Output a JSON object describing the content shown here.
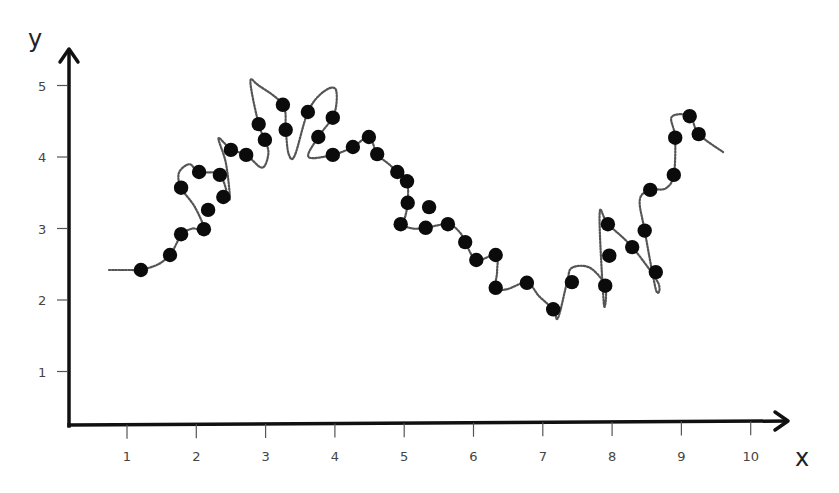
{
  "chart_data": {
    "type": "scatter",
    "title": "",
    "xlabel": "x",
    "ylabel": "y",
    "xlim": [
      0.2,
      10.6
    ],
    "ylim": [
      0.2,
      5.5
    ],
    "x_ticks": [
      1,
      2,
      3,
      4,
      5,
      6,
      7,
      8,
      9,
      10
    ],
    "y_ticks": [
      1,
      2,
      3,
      4,
      5
    ],
    "grid": false,
    "legend": null,
    "colors": {
      "points": "#0b0b0b",
      "curve": "#555555",
      "axis": "#111111",
      "tick_label": "#444444"
    },
    "series": [
      {
        "name": "data points",
        "style": "filled-circle",
        "x": [
          1.2,
          1.62,
          1.78,
          2.11,
          2.17,
          1.78,
          2.04,
          2.34,
          2.39,
          2.5,
          2.72,
          2.9,
          2.99,
          3.25,
          3.29,
          3.61,
          3.76,
          3.97,
          3.97,
          4.26,
          4.49,
          4.61,
          4.9,
          5.04,
          5.05,
          5.36,
          4.95,
          5.31,
          5.63,
          5.88,
          6.04,
          6.32,
          6.32,
          6.77,
          7.15,
          7.42,
          7.9,
          7.96,
          7.94,
          8.29,
          8.47,
          8.63,
          8.55,
          8.89,
          8.91,
          9.12,
          9.25
        ],
        "y": [
          2.42,
          2.63,
          2.92,
          2.99,
          3.26,
          3.57,
          3.79,
          3.75,
          3.44,
          4.1,
          4.03,
          4.46,
          4.24,
          4.73,
          4.38,
          4.63,
          4.28,
          4.55,
          4.03,
          4.14,
          4.28,
          4.04,
          3.79,
          3.66,
          3.36,
          3.3,
          3.06,
          3.01,
          3.06,
          2.81,
          2.56,
          2.63,
          2.17,
          2.24,
          1.87,
          2.25,
          2.2,
          2.62,
          3.06,
          2.74,
          2.97,
          2.39,
          3.54,
          3.75,
          4.27,
          4.57,
          4.32
        ]
      },
      {
        "name": "overfit curve",
        "style": "dotted-line",
        "x": [
          0.74,
          1.05,
          1.2,
          1.45,
          1.62,
          1.72,
          1.78,
          1.95,
          2.11,
          1.98,
          1.78,
          1.75,
          1.9,
          2.04,
          2.34,
          2.48,
          2.43,
          2.32,
          2.4,
          2.5,
          2.72,
          2.95,
          3.04,
          2.99,
          2.9,
          2.78,
          2.9,
          3.25,
          3.29,
          3.33,
          3.42,
          3.61,
          3.82,
          4.01,
          3.99,
          3.76,
          3.62,
          3.97,
          4.26,
          4.49,
          4.61,
          4.78,
          4.9,
          5.04,
          5.05,
          5.0,
          4.95,
          5.12,
          5.31,
          5.63,
          5.8,
          5.88,
          6.04,
          6.32,
          6.34,
          6.32,
          6.48,
          6.77,
          6.95,
          7.15,
          7.22,
          7.35,
          7.42,
          7.68,
          7.9,
          7.88,
          7.82,
          7.94,
          8.29,
          8.66,
          8.63,
          8.47,
          8.4,
          8.55,
          8.77,
          8.89,
          8.91,
          8.86,
          9.12,
          9.25,
          9.6
        ],
        "y": [
          2.42,
          2.42,
          2.42,
          2.5,
          2.63,
          2.8,
          2.92,
          3.0,
          2.99,
          3.3,
          3.57,
          3.78,
          3.9,
          3.79,
          3.75,
          3.4,
          3.9,
          4.25,
          4.2,
          4.1,
          4.03,
          3.85,
          4.05,
          4.24,
          4.46,
          5.05,
          5.0,
          4.73,
          4.38,
          4.05,
          4.02,
          4.63,
          4.9,
          4.95,
          4.6,
          4.28,
          4.0,
          4.03,
          4.14,
          4.28,
          4.04,
          3.9,
          3.79,
          3.66,
          3.36,
          3.12,
          3.06,
          3.0,
          3.01,
          3.06,
          2.95,
          2.81,
          2.56,
          2.63,
          2.4,
          2.17,
          2.15,
          2.24,
          2.05,
          1.87,
          1.75,
          2.25,
          2.45,
          2.45,
          2.2,
          1.95,
          3.2,
          3.06,
          2.74,
          2.25,
          2.15,
          2.97,
          3.4,
          3.54,
          3.56,
          3.75,
          4.27,
          4.56,
          4.57,
          4.32,
          4.07
        ]
      }
    ]
  },
  "axes": {
    "x_label": "x",
    "y_label": "y",
    "x_tick_labels": [
      "1",
      "2",
      "3",
      "4",
      "5",
      "6",
      "7",
      "8",
      "9",
      "10"
    ],
    "y_tick_labels": [
      "1",
      "2",
      "3",
      "4",
      "5"
    ]
  }
}
